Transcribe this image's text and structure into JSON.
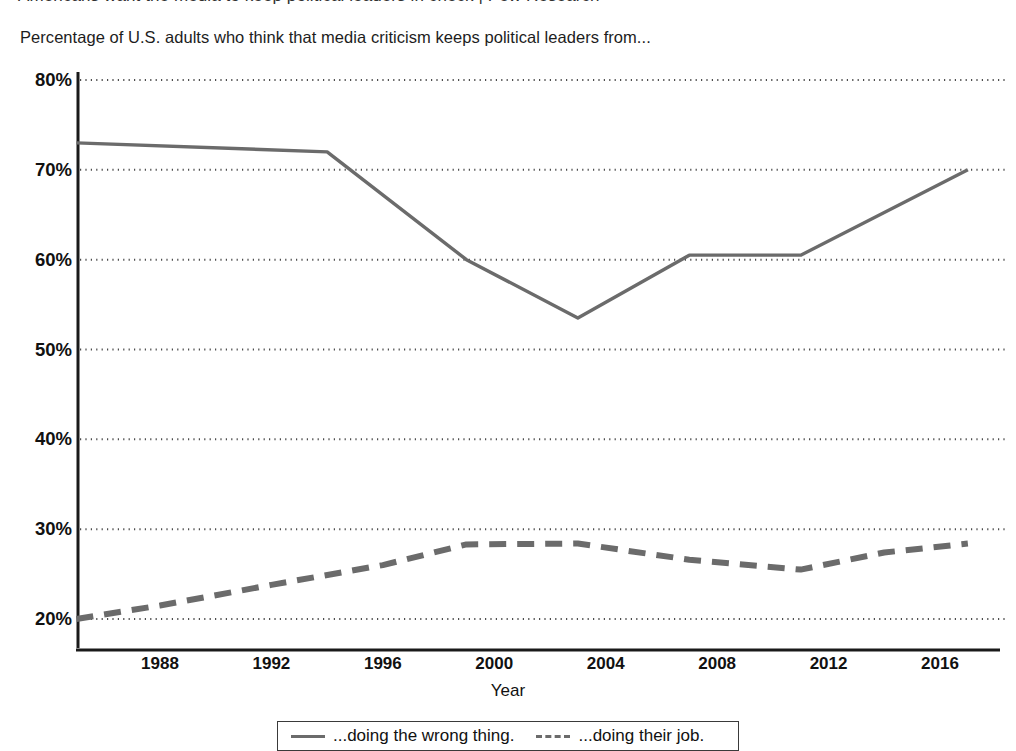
{
  "cut_off_line": {
    "text": "Americans want the media to keep political leaders in check | Pew Research"
  },
  "chart_title": "Percentage of U.S. adults who think that media criticism keeps political leaders from...",
  "axis": {
    "x_title": "Year",
    "y_ticks": [
      "20%",
      "30%",
      "40%",
      "50%",
      "60%",
      "70%",
      "80%"
    ],
    "x_ticks": [
      "1988",
      "1992",
      "1996",
      "2000",
      "2004",
      "2008",
      "2012",
      "2016"
    ]
  },
  "legend": {
    "items": [
      {
        "label": "...doing the wrong thing.",
        "style": "solid",
        "color": "#6b6b6b"
      },
      {
        "label": "...doing their job.",
        "style": "dashed",
        "color": "#6b6b6b"
      }
    ]
  },
  "colors": {
    "line": "#6b6b6b",
    "axis": "#1a1a1a",
    "grid": "#4d4d4d"
  },
  "chart_data": {
    "type": "line",
    "title": "Percentage of U.S. adults who think that media criticism keeps political leaders from...",
    "xlabel": "Year",
    "ylabel": "",
    "xlim": [
      1985,
      2018
    ],
    "ylim": [
      18,
      80
    ],
    "grid": true,
    "grid_axis": "y",
    "legend_position": "bottom",
    "y_tick_values": [
      20,
      30,
      40,
      50,
      60,
      70,
      80
    ],
    "x_tick_values": [
      1988,
      1992,
      1996,
      2000,
      2004,
      2008,
      2012,
      2016
    ],
    "series": [
      {
        "name": "...doing the wrong thing.",
        "style": "solid",
        "color": "#6b6b6b",
        "x": [
          1985,
          1994,
          1999,
          2003,
          2007,
          2011,
          2017
        ],
        "values": [
          73.0,
          72.0,
          60.0,
          53.5,
          60.5,
          60.5,
          70.0
        ]
      },
      {
        "name": "...doing their job.",
        "style": "dashed",
        "color": "#6b6b6b",
        "x": [
          1985,
          1988,
          1992,
          1996,
          1999,
          2003,
          2007,
          2011,
          2014,
          2017
        ],
        "values": [
          20.0,
          21.5,
          23.8,
          26.0,
          28.3,
          28.4,
          26.6,
          25.5,
          27.4,
          28.4
        ]
      }
    ]
  }
}
